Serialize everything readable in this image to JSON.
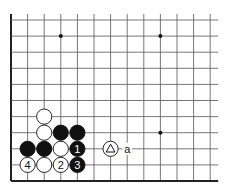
{
  "diagram": {
    "type": "go-board-corner",
    "view": "lower-left corner",
    "grid": {
      "columns": 13,
      "rows": 11,
      "x0": 11,
      "dx": 16.6,
      "y0": 20,
      "dy": 16.1,
      "line_color": "#555555",
      "edge_color": "#222222"
    },
    "star_points": [
      {
        "col": 3,
        "row": 1
      },
      {
        "col": 9,
        "row": 1
      },
      {
        "col": 9,
        "row": 7
      }
    ],
    "stones": [
      {
        "color": "white",
        "col": 2,
        "row": 6,
        "label": ""
      },
      {
        "color": "white",
        "col": 2,
        "row": 7,
        "label": ""
      },
      {
        "color": "black",
        "col": 3,
        "row": 7,
        "label": ""
      },
      {
        "color": "black",
        "col": 4,
        "row": 7,
        "label": ""
      },
      {
        "color": "black",
        "col": 1,
        "row": 8,
        "label": ""
      },
      {
        "color": "black",
        "col": 2,
        "row": 8,
        "label": ""
      },
      {
        "color": "white",
        "col": 3,
        "row": 8,
        "label": ""
      },
      {
        "color": "black",
        "col": 4,
        "row": 8,
        "label": "1"
      },
      {
        "color": "white",
        "col": 1,
        "row": 9,
        "label": "4"
      },
      {
        "color": "white",
        "col": 2,
        "row": 9,
        "label": ""
      },
      {
        "color": "white",
        "col": 3,
        "row": 9,
        "label": "2"
      },
      {
        "color": "black",
        "col": 4,
        "row": 9,
        "label": "3"
      },
      {
        "color": "white",
        "col": 6,
        "row": 8,
        "label": "triangle",
        "marker": "triangle"
      }
    ],
    "annotations": [
      {
        "text": "a",
        "col": 7,
        "row": 8
      }
    ]
  }
}
